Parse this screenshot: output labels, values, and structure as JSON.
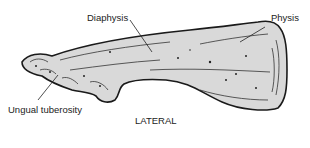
{
  "diagram": {
    "view_label": "LATERAL",
    "labels": {
      "diaphysis": "Diaphysis",
      "physis": "Physis",
      "ungual_tuberosity": "Ungual tuberosity"
    },
    "colors": {
      "bone_fill": "#d9d9d9",
      "outline": "#1a1a1a",
      "text": "#222222",
      "background": "#ffffff"
    }
  }
}
